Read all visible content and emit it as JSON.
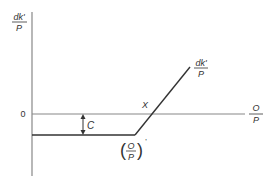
{
  "diagram": {
    "y_axis_label": {
      "numerator": "dk'",
      "denominator": "P"
    },
    "x_axis_label": {
      "numerator": "O",
      "denominator": "P"
    },
    "zero_label": "0",
    "intersection_label": "X",
    "gap_label": "C",
    "curve_label": {
      "numerator": "dk'",
      "denominator": "P"
    },
    "kink_label": {
      "numerator": "O",
      "denominator": "P",
      "prime": "'"
    },
    "colors": {
      "axis": "#888888",
      "curve": "#333333",
      "text": "#333333"
    }
  }
}
